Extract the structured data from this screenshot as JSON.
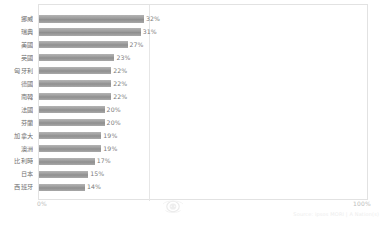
{
  "chart_data": {
    "type": "bar",
    "orientation": "horizontal",
    "title": "",
    "subtitle": "",
    "xlabel": "",
    "ylabel": "",
    "xlim": [
      0,
      100
    ],
    "grid": true,
    "gridlines_at": [
      50
    ],
    "legend": false,
    "categories": [
      "挪威",
      "瑞典",
      "美國",
      "英國",
      "匈牙利",
      "德國",
      "南韓",
      "法國",
      "芬蘭",
      "加拿大",
      "澳洲",
      "比利時",
      "日本",
      "西班牙"
    ],
    "values": [
      32,
      31,
      27,
      23,
      22,
      22,
      22,
      20,
      20,
      19,
      19,
      17,
      15,
      14
    ],
    "value_labels": [
      "32%",
      "31%",
      "27%",
      "23%",
      "22%",
      "22%",
      "22%",
      "20%",
      "20%",
      "19%",
      "19%",
      "17%",
      "15%",
      "14%"
    ],
    "axis_ticks": [
      "0%",
      "100%"
    ],
    "series": [
      {
        "name": "",
        "values": [
          32,
          31,
          27,
          23,
          22,
          22,
          22,
          20,
          20,
          19,
          19,
          17,
          15,
          14
        ]
      }
    ],
    "colors": {
      "bar": "#9a9a9a",
      "bar_highlight": "#b4b4b4",
      "bar_shadow": "#8e8e8e",
      "label_text": "#6f6f6f",
      "value_text": "#7a7a7a",
      "axis_text": "#bdbdbd",
      "frame_border": "#e2e2e2",
      "gridline": "#e6e6e6",
      "background": "#ffffff"
    }
  },
  "axis": {
    "min_label": "0%",
    "max_label": "100%"
  },
  "footer": {
    "source": "Source: ipsos MORI | A Nation(s)"
  },
  "watermark": {
    "icon": "emblem-watermark-icon"
  }
}
